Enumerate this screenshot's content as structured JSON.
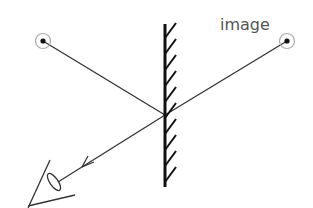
{
  "diagram": {
    "type": "plane-mirror-reflection",
    "labels": {
      "image": "image"
    },
    "elements": [
      {
        "id": "object",
        "kind": "point-source",
        "x": 43,
        "y": 41
      },
      {
        "id": "image",
        "kind": "virtual-image",
        "x": 287,
        "y": 41,
        "label": "image"
      },
      {
        "id": "mirror",
        "kind": "plane-mirror",
        "x": 165,
        "y1": 24,
        "y2": 187,
        "hatch_side": "right"
      },
      {
        "id": "incident-ray",
        "from": "object",
        "to": "reflection-point"
      },
      {
        "id": "virtual-ray",
        "from": "image",
        "to": "reflection-point"
      },
      {
        "id": "reflected-ray",
        "from": "reflection-point",
        "to": "eye",
        "arrow": "toward-eye"
      },
      {
        "id": "eye",
        "kind": "observer-eye",
        "x": 53,
        "y": 182
      }
    ],
    "reflection_point": {
      "x": 165,
      "y": 115
    },
    "colors": {
      "lines": "#333333",
      "mirror": "#111111",
      "point_ring": "#aaaaaa",
      "label": "#555555"
    }
  }
}
